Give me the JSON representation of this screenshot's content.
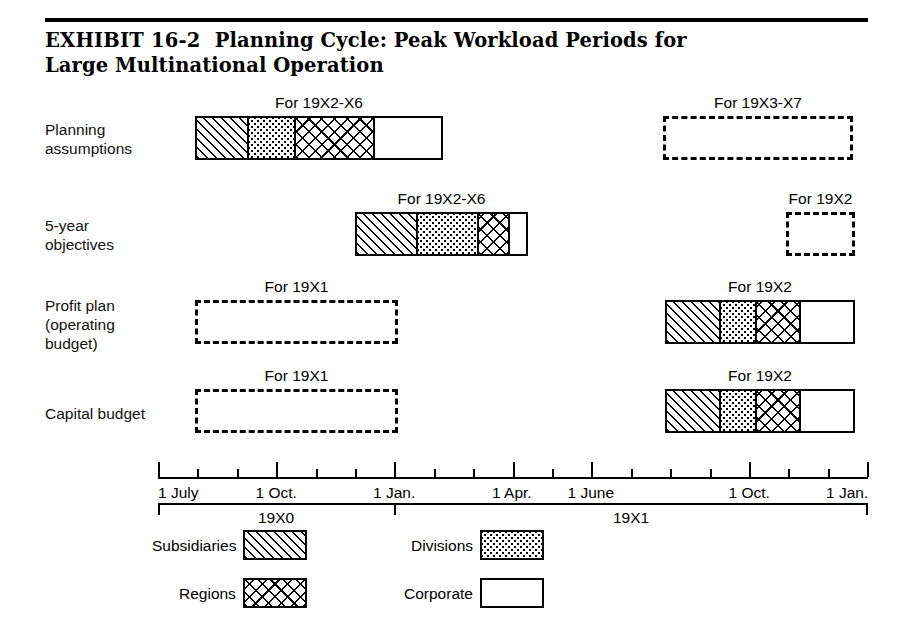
{
  "exhibit": {
    "number_label": "EXHIBIT 16-2",
    "title": "Planning Cycle: Peak Workload Periods for Large Multinational Operation"
  },
  "chart_data": {
    "type": "bar",
    "title": "Planning Cycle: Peak Workload Periods for Large Multinational Operation",
    "xlabel": "",
    "ylabel": "",
    "grid": false,
    "legend_position": "bottom",
    "axis": {
      "ticks": [
        "1 July",
        "1 Oct.",
        "1 Jan.",
        "1 Apr.",
        "1 June",
        "1 Oct.",
        "1 Jan."
      ],
      "tick_positions_px": [
        158,
        276,
        394,
        512,
        591,
        749,
        868
      ],
      "minor_tick_step_px": 39.4,
      "years": [
        {
          "label": "19X0",
          "start_px": 158,
          "end_px": 394
        },
        {
          "label": "19X1",
          "start_px": 394,
          "end_px": 868
        }
      ]
    },
    "categories": [
      "Planning assumptions",
      "5-year objectives",
      "Profit plan (operating budget)",
      "Capital budget"
    ],
    "rows": [
      {
        "label_lines": [
          "Planning",
          "assumptions"
        ],
        "bars": [
          {
            "caption": "For 19X2-X6",
            "style": "segmented",
            "x": 195,
            "width": 248,
            "segments": [
              {
                "name": "Subsidiaries",
                "pattern": "subsidiaries",
                "width": 51
              },
              {
                "name": "Divisions",
                "pattern": "divisions",
                "width": 48
              },
              {
                "name": "Regions",
                "pattern": "regions",
                "width": 80
              },
              {
                "name": "Corporate",
                "pattern": "corporate",
                "width": 69
              }
            ]
          },
          {
            "caption": "For 19X3-X7",
            "style": "dashed",
            "x": 663,
            "width": 190
          }
        ]
      },
      {
        "label_lines": [
          "5-year",
          "objectives"
        ],
        "bars": [
          {
            "caption": "For 19X2-X6",
            "style": "segmented",
            "x": 355,
            "width": 173,
            "segments": [
              {
                "name": "Subsidiaries",
                "pattern": "subsidiaries",
                "width": 60
              },
              {
                "name": "Divisions",
                "pattern": "divisions",
                "width": 63
              },
              {
                "name": "Regions",
                "pattern": "regions",
                "width": 32
              },
              {
                "name": "Corporate",
                "pattern": "corporate",
                "width": 18
              }
            ]
          },
          {
            "caption": "For 19X2",
            "style": "dashed",
            "x": 786,
            "width": 69
          }
        ]
      },
      {
        "label_lines": [
          "Profit plan",
          "(operating",
          "budget)"
        ],
        "bars": [
          {
            "caption": "For 19X1",
            "style": "dashed",
            "x": 195,
            "width": 203
          },
          {
            "caption": "For 19X2",
            "style": "segmented",
            "x": 665,
            "width": 190,
            "segments": [
              {
                "name": "Subsidiaries",
                "pattern": "subsidiaries",
                "width": 53
              },
              {
                "name": "Divisions",
                "pattern": "divisions",
                "width": 37
              },
              {
                "name": "Regions",
                "pattern": "regions",
                "width": 45
              },
              {
                "name": "Corporate",
                "pattern": "corporate",
                "width": 55
              }
            ]
          }
        ]
      },
      {
        "label_lines": [
          "Capital budget"
        ],
        "bars": [
          {
            "caption": "For 19X1",
            "style": "dashed",
            "x": 195,
            "width": 203
          },
          {
            "caption": "For 19X2",
            "style": "segmented",
            "x": 665,
            "width": 190,
            "segments": [
              {
                "name": "Subsidiaries",
                "pattern": "subsidiaries",
                "width": 53
              },
              {
                "name": "Divisions",
                "pattern": "divisions",
                "width": 37
              },
              {
                "name": "Regions",
                "pattern": "regions",
                "width": 45
              },
              {
                "name": "Corporate",
                "pattern": "corporate",
                "width": 55
              }
            ]
          }
        ]
      }
    ],
    "legend": [
      {
        "label": "Subsidiaries",
        "pattern": "subsidiaries"
      },
      {
        "label": "Divisions",
        "pattern": "divisions"
      },
      {
        "label": "Regions",
        "pattern": "regions"
      },
      {
        "label": "Corporate",
        "pattern": "corporate"
      }
    ]
  }
}
